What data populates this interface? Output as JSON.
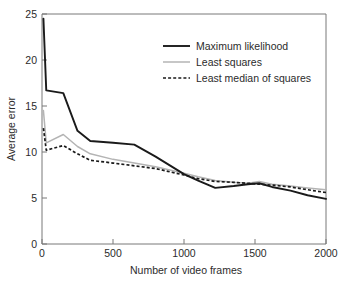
{
  "chart_data": {
    "type": "line",
    "title": "",
    "xlabel": "Number of video frames",
    "ylabel": "Average error",
    "xlim": [
      0,
      2000
    ],
    "ylim": [
      0,
      25
    ],
    "xticks": [
      0,
      500,
      1000,
      1500,
      2000
    ],
    "xtick_labels": [
      "0",
      "500",
      "1000",
      "1500",
      "2000"
    ],
    "yticks": [
      0,
      5,
      10,
      15,
      20,
      25
    ],
    "ytick_labels": [
      "0",
      "5",
      "10",
      "15",
      "20",
      "25"
    ],
    "grid": false,
    "legend_position": "upper right",
    "colors": {
      "maximum_likelihood": "#1a1a1a",
      "least_squares": "#b4b4b4",
      "least_median_of_squares": "#1a1a1a",
      "axis": "#787878",
      "text": "#2b2b2b",
      "background": "#ffffff"
    },
    "x": [
      10,
      30,
      150,
      250,
      340,
      500,
      650,
      800,
      1000,
      1100,
      1220,
      1350,
      1450,
      1530,
      1620,
      1750,
      1870,
      2000
    ],
    "series": [
      {
        "name": "Maximum likelihood",
        "style": "solid",
        "color": "#1a1a1a",
        "values": [
          24.5,
          16.7,
          16.4,
          12.3,
          11.2,
          11.0,
          10.8,
          9.5,
          7.6,
          6.9,
          6.1,
          6.3,
          6.5,
          6.6,
          6.2,
          5.8,
          5.3,
          4.9
        ]
      },
      {
        "name": "Least squares",
        "style": "solid",
        "color": "#b4b4b4",
        "values": [
          14.5,
          11.0,
          11.9,
          10.6,
          9.8,
          9.2,
          8.8,
          8.4,
          7.7,
          7.3,
          6.9,
          6.7,
          6.6,
          6.8,
          6.5,
          6.3,
          6.1,
          5.9
        ]
      },
      {
        "name": "Least median of squares",
        "style": "dashed",
        "color": "#1a1a1a",
        "values": [
          12.6,
          10.2,
          10.7,
          9.8,
          9.1,
          8.8,
          8.5,
          8.2,
          7.5,
          7.1,
          6.8,
          6.7,
          6.6,
          6.5,
          6.4,
          6.2,
          5.9,
          5.6
        ]
      }
    ]
  },
  "legend": {
    "items": [
      {
        "label": "Maximum likelihood"
      },
      {
        "label": "Least squares"
      },
      {
        "label": "Least median of squares"
      }
    ]
  }
}
